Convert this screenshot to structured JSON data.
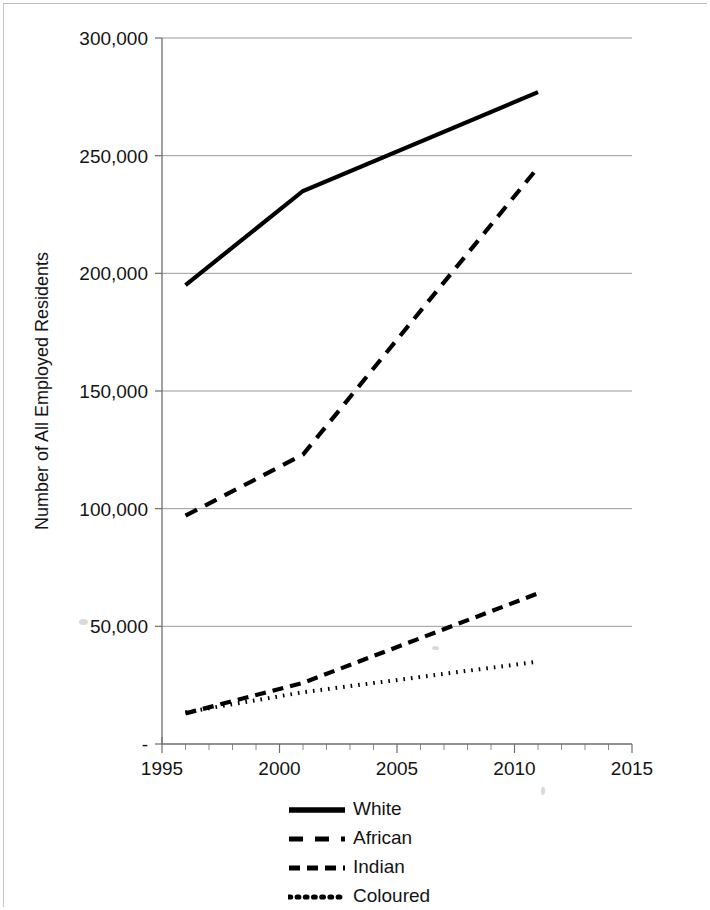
{
  "chart_data": {
    "type": "line",
    "title": "",
    "xlabel": "",
    "ylabel": "Number of All Employed Residents",
    "xlim": [
      1995,
      2015
    ],
    "ylim": [
      0,
      300000
    ],
    "grid": true,
    "legend_position": "bottom",
    "y_ticks": [
      "-",
      "50,000",
      "100,000",
      "150,000",
      "200,000",
      "250,000",
      "300,000"
    ],
    "y_tick_values": [
      0,
      50000,
      100000,
      150000,
      200000,
      250000,
      300000
    ],
    "x_ticks": [
      "1995",
      "2000",
      "2005",
      "2010",
      "2015"
    ],
    "x_tick_values": [
      1995,
      2000,
      2005,
      2010,
      2015
    ],
    "x_minor_step": 1,
    "x": [
      1996,
      2001,
      2011
    ],
    "series": [
      {
        "name": "White",
        "style": "solid",
        "color": "#000000",
        "values": [
          195000,
          235000,
          277000
        ]
      },
      {
        "name": "African",
        "style": "long-dash",
        "color": "#000000",
        "values": [
          97000,
          123000,
          245000
        ]
      },
      {
        "name": "Indian",
        "style": "dash",
        "color": "#000000",
        "values": [
          13000,
          26000,
          64000
        ]
      },
      {
        "name": "Coloured",
        "style": "dotted",
        "color": "#000000",
        "values": [
          13500,
          22000,
          35000
        ]
      }
    ]
  },
  "legend": {
    "items": [
      {
        "label": "White"
      },
      {
        "label": "African"
      },
      {
        "label": "Indian"
      },
      {
        "label": "Coloured"
      }
    ]
  },
  "axis": {
    "y_title": "Number of All Employed Residents"
  }
}
